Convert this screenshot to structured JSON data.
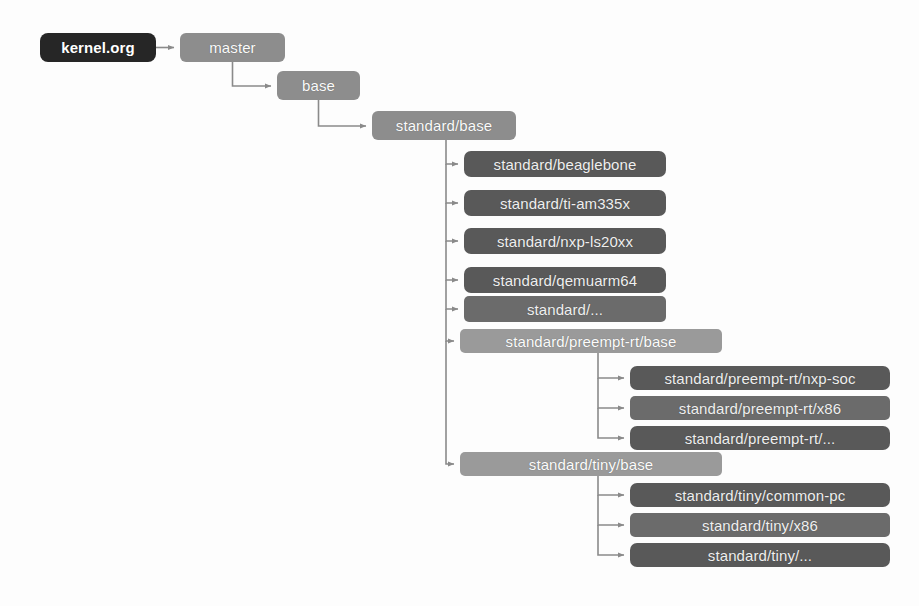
{
  "diagram": {
    "background_color": "#fdfdfd",
    "colors": {
      "root_box": "#262626",
      "mid_box": "#8d8d8d",
      "group_box": "#9a9a9a",
      "leaf_box": "#595959",
      "leaf2_box": "#6b6b6b",
      "connector": "#8a8a8a",
      "label_text": "#f2f2f2"
    },
    "nodes": [
      {
        "id": "kernel-org",
        "label": "kernel.org",
        "kind": "root",
        "x": 40,
        "y": 33,
        "w": 116,
        "h": 29
      },
      {
        "id": "master",
        "label": "master",
        "kind": "mid",
        "x": 180,
        "y": 33,
        "w": 105,
        "h": 29
      },
      {
        "id": "base",
        "label": "base",
        "kind": "mid",
        "x": 277,
        "y": 71,
        "w": 83,
        "h": 29
      },
      {
        "id": "standard-base",
        "label": "standard/base",
        "kind": "mid",
        "x": 372,
        "y": 111,
        "w": 144,
        "h": 29
      },
      {
        "id": "standard-beaglebone",
        "label": "standard/beaglebone",
        "kind": "leaf",
        "x": 464,
        "y": 151,
        "w": 202,
        "h": 26
      },
      {
        "id": "standard-ti-am335x",
        "label": "standard/ti-am335x",
        "kind": "leaf",
        "x": 464,
        "y": 190,
        "w": 202,
        "h": 26
      },
      {
        "id": "standard-nxp-ls20xx",
        "label": "standard/nxp-ls20xx",
        "kind": "leaf",
        "x": 464,
        "y": 228,
        "w": 202,
        "h": 26
      },
      {
        "id": "standard-qemuarm64",
        "label": "standard/qemuarm64",
        "kind": "leaf",
        "x": 464,
        "y": 267,
        "w": 202,
        "h": 26
      },
      {
        "id": "standard-dots",
        "label": "standard/...",
        "kind": "leaf2",
        "x": 464,
        "y": 296,
        "w": 202,
        "h": 26
      },
      {
        "id": "standard-preempt-rt-base",
        "label": "standard/preempt-rt/base",
        "kind": "group",
        "x": 460,
        "y": 329,
        "w": 262,
        "h": 24
      },
      {
        "id": "preempt-rt-nxp-soc",
        "label": "standard/preempt-rt/nxp-soc",
        "kind": "leaf",
        "x": 630,
        "y": 366,
        "w": 260,
        "h": 24
      },
      {
        "id": "preempt-rt-x86",
        "label": "standard/preempt-rt/x86",
        "kind": "leaf2",
        "x": 630,
        "y": 396,
        "w": 260,
        "h": 24
      },
      {
        "id": "preempt-rt-dots",
        "label": "standard/preempt-rt/...",
        "kind": "leaf",
        "x": 630,
        "y": 426,
        "w": 260,
        "h": 24
      },
      {
        "id": "standard-tiny-base",
        "label": "standard/tiny/base",
        "kind": "group",
        "x": 460,
        "y": 452,
        "w": 262,
        "h": 24
      },
      {
        "id": "tiny-common-pc",
        "label": "standard/tiny/common-pc",
        "kind": "leaf",
        "x": 630,
        "y": 483,
        "w": 260,
        "h": 24
      },
      {
        "id": "tiny-x86",
        "label": "standard/tiny/x86",
        "kind": "leaf2",
        "x": 630,
        "y": 513,
        "w": 260,
        "h": 24
      },
      {
        "id": "tiny-dots",
        "label": "standard/tiny/...",
        "kind": "leaf",
        "x": 630,
        "y": 543,
        "w": 260,
        "h": 24
      }
    ],
    "edges": [
      {
        "from": "kernel-org",
        "to": "master",
        "type": "straight"
      },
      {
        "from": "master",
        "to": "base",
        "type": "elbow"
      },
      {
        "from": "base",
        "to": "standard-base",
        "type": "elbow"
      },
      {
        "from": "standard-base",
        "to": "standard-beaglebone",
        "type": "trunk"
      },
      {
        "from": "standard-base",
        "to": "standard-ti-am335x",
        "type": "trunk"
      },
      {
        "from": "standard-base",
        "to": "standard-nxp-ls20xx",
        "type": "trunk"
      },
      {
        "from": "standard-base",
        "to": "standard-qemuarm64",
        "type": "trunk"
      },
      {
        "from": "standard-base",
        "to": "standard-dots",
        "type": "trunk"
      },
      {
        "from": "standard-base",
        "to": "standard-preempt-rt-base",
        "type": "trunk"
      },
      {
        "from": "standard-base",
        "to": "standard-tiny-base",
        "type": "trunk"
      },
      {
        "from": "standard-preempt-rt-base",
        "to": "preempt-rt-nxp-soc",
        "type": "trunk"
      },
      {
        "from": "standard-preempt-rt-base",
        "to": "preempt-rt-x86",
        "type": "trunk"
      },
      {
        "from": "standard-preempt-rt-base",
        "to": "preempt-rt-dots",
        "type": "trunk"
      },
      {
        "from": "standard-tiny-base",
        "to": "tiny-common-pc",
        "type": "trunk"
      },
      {
        "from": "standard-tiny-base",
        "to": "tiny-x86",
        "type": "trunk"
      },
      {
        "from": "standard-tiny-base",
        "to": "tiny-dots",
        "type": "trunk"
      }
    ]
  }
}
